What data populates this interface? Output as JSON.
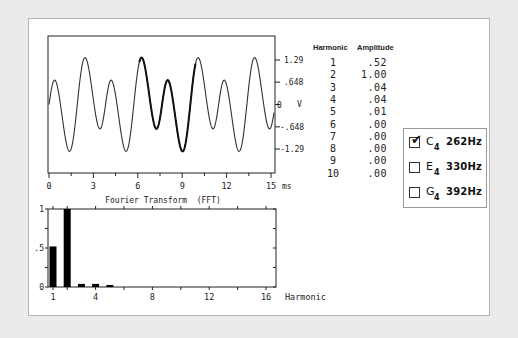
{
  "wave_plot": {
    "x_ticks": [
      "0",
      "3",
      "6",
      "9",
      "12",
      "15"
    ],
    "x_unit": "ms",
    "y_ticks": [
      "1.29",
      ".648",
      "0",
      "-.648",
      "-1.29"
    ],
    "y_unit": "V"
  },
  "fft_plot": {
    "title": "Fourier Transform  (FFT)",
    "y_ticks": [
      "1",
      ".5",
      "0"
    ],
    "x_ticks": [
      "1",
      "4",
      "8",
      "12",
      "16"
    ],
    "x_label": "Harmonic"
  },
  "table": {
    "headers": {
      "harmonic": "Harmonic",
      "amplitude": "Amplitude"
    },
    "rows": [
      {
        "harmonic": "1",
        "amplitude": ".52"
      },
      {
        "harmonic": "2",
        "amplitude": "1.00"
      },
      {
        "harmonic": "3",
        "amplitude": ".04"
      },
      {
        "harmonic": "4",
        "amplitude": ".04"
      },
      {
        "harmonic": "5",
        "amplitude": ".01"
      },
      {
        "harmonic": "6",
        "amplitude": ".00"
      },
      {
        "harmonic": "7",
        "amplitude": ".00"
      },
      {
        "harmonic": "8",
        "amplitude": ".00"
      },
      {
        "harmonic": "9",
        "amplitude": ".00"
      },
      {
        "harmonic": "10",
        "amplitude": ".00"
      }
    ]
  },
  "notes": [
    {
      "note": "C",
      "octave": "4",
      "freq": "262Hz",
      "checked": true
    },
    {
      "note": "E",
      "octave": "4",
      "freq": "330Hz",
      "checked": false
    },
    {
      "note": "G",
      "octave": "4",
      "freq": "392Hz",
      "checked": false
    }
  ],
  "chart_data": [
    {
      "type": "line",
      "title": "",
      "xlabel": "ms",
      "ylabel": "V",
      "xlim": [
        0,
        15
      ],
      "ylim": [
        -1.6,
        1.6
      ],
      "y_ticks": [
        1.29,
        0.648,
        0,
        -0.648,
        -1.29
      ],
      "x_ticks": [
        0,
        3,
        6,
        9,
        12,
        15
      ],
      "description": "Waveform of C4 (262 Hz) tone composed of harmonics; one period (~6.1-9.9 ms) highlighted bold",
      "fundamental_hz": 262,
      "period_ms": 3.82,
      "components": [
        {
          "harmonic": 1,
          "amplitude": -0.52
        },
        {
          "harmonic": 2,
          "amplitude": 1.0
        },
        {
          "harmonic": 3,
          "amplitude": 0.04
        },
        {
          "harmonic": 4,
          "amplitude": 0.04
        },
        {
          "harmonic": 5,
          "amplitude": 0.01
        }
      ],
      "highlight_ms": [
        6.1,
        9.9
      ]
    },
    {
      "type": "bar",
      "title": "Fourier Transform  (FFT)",
      "xlabel": "Harmonic",
      "ylabel": "",
      "categories": [
        1,
        2,
        3,
        4,
        5,
        6,
        7,
        8,
        9,
        10,
        11,
        12,
        13,
        14,
        15,
        16
      ],
      "values": [
        0.52,
        1.0,
        0.04,
        0.04,
        0.01,
        0,
        0,
        0,
        0,
        0,
        0,
        0,
        0,
        0,
        0,
        0
      ],
      "ylim": [
        0,
        1
      ],
      "y_ticks": [
        0,
        0.5,
        1
      ],
      "x_ticks": [
        1,
        4,
        8,
        12,
        16
      ]
    }
  ]
}
